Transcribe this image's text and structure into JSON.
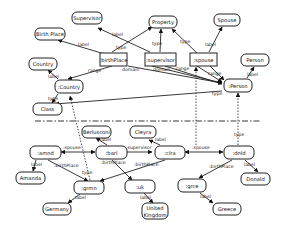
{
  "diagram": {
    "schema_nodes": {
      "supervisor_class": "Supervisor",
      "property": "Property",
      "spouse_class": "Spouse",
      "birth_place_class": "Birth Place",
      "birthplace_prop": ":birthPlace",
      "supervisor_prop": ":supervisor",
      "spouse_prop": ":spouse",
      "country_label": "Country",
      "country": ":Country",
      "person_label": "Person",
      "person": ":Person",
      "class": "Class"
    },
    "instance_nodes": {
      "berlusconi": "Berlusconi",
      "cleyra": "Cleyra",
      "amnd": ":amnd",
      "barl": ":barl",
      "clra": ":clra",
      "dnld": ":dnld",
      "amanda": "Amanda",
      "donald": "Donald",
      "grmn": ":grmn",
      "uk": ":uk",
      "grce": ":grce",
      "germany": "Germany",
      "united_kingdom_1": "United",
      "united_kingdom_2": "Kingdom",
      "greece": "Greece"
    },
    "edge_labels": {
      "label": "label",
      "type": "type",
      "range": "range",
      "domain": "domain",
      "spouse": ":spouse",
      "supervisor": ":supervisor",
      "birthPlace": ":birthPlace"
    }
  }
}
